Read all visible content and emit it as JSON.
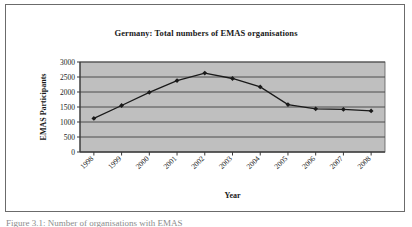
{
  "figure": {
    "caption_clipped": "Figure 3.1: Number of organisations with EMAS"
  },
  "chart_data": {
    "type": "line",
    "title": "Germany: Total numbers of EMAS organisations",
    "xlabel": "Year",
    "ylabel": "EMAS Participants",
    "categories": [
      "1998",
      "1999",
      "2000",
      "2001",
      "2002",
      "2003",
      "2004",
      "2005",
      "2006",
      "2007",
      "2008"
    ],
    "values": [
      1120,
      1550,
      1990,
      2380,
      2630,
      2450,
      2170,
      1580,
      1440,
      1420,
      1370
    ],
    "ylim": [
      0,
      3000
    ],
    "yticks": [
      0,
      500,
      1000,
      1500,
      2000,
      2500,
      3000
    ],
    "ytick_labels": [
      "0",
      "500",
      "1000",
      "1500",
      "2000",
      "2500",
      "3000"
    ],
    "grid": true,
    "legend": "none",
    "marker": "diamond",
    "plot_background": "#bfbfbf",
    "line_color": "#1a1a1a",
    "gridline_color": "#4d4d4d",
    "xtick_rotation": -45
  }
}
